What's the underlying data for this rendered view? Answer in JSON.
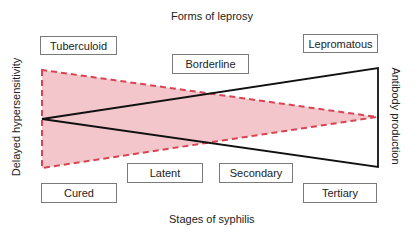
{
  "diagram": {
    "top_title": "Forms of leprosy",
    "bottom_title": "Stages of syphilis",
    "left_axis_label": "Delayed hypersensitivity",
    "right_axis_label": "Antibody production",
    "leprosy_forms": [
      {
        "label": "Tuberculoid"
      },
      {
        "label": "Borderline"
      },
      {
        "label": "Lepromatous"
      }
    ],
    "syphilis_stages": [
      {
        "label": "Cured"
      },
      {
        "label": "Latent"
      },
      {
        "label": "Secondary"
      },
      {
        "label": "Tertiary"
      }
    ],
    "colors": {
      "hypersensitivity_fill": "#f3c6cb",
      "hypersensitivity_stroke": "#d94452",
      "antibody_stroke": "#111111",
      "box_border": "#7a7a7a"
    }
  }
}
